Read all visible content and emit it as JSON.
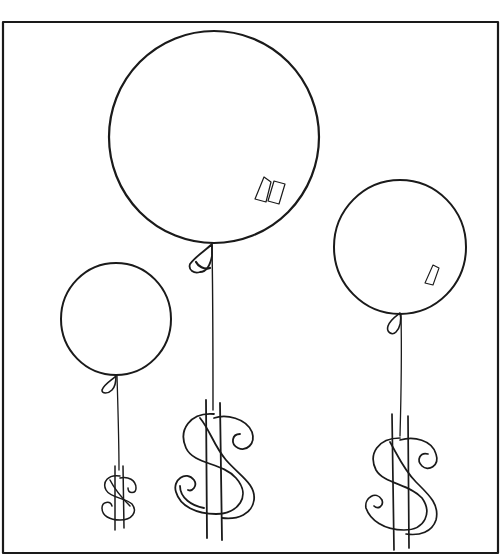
{
  "illustration": {
    "subject": "three balloons carrying dollar signs",
    "style": "black ink line drawing on white",
    "colors": {
      "ink": "#1a1a1a",
      "paper": "#ffffff"
    },
    "frame": {
      "x": 3,
      "y": 22,
      "width": 495,
      "height": 531
    },
    "balloons": [
      {
        "name": "small-left",
        "cx": 116,
        "cy": 319,
        "rx": 55,
        "ry": 56,
        "glyph": "$",
        "glyph_size": "small"
      },
      {
        "name": "large-center",
        "cx": 214,
        "cy": 137,
        "rx": 105,
        "ry": 106,
        "glyph": "$",
        "glyph_size": "large"
      },
      {
        "name": "medium-right",
        "cx": 400,
        "cy": 247,
        "rx": 66,
        "ry": 67,
        "glyph": "$",
        "glyph_size": "medium"
      }
    ]
  }
}
